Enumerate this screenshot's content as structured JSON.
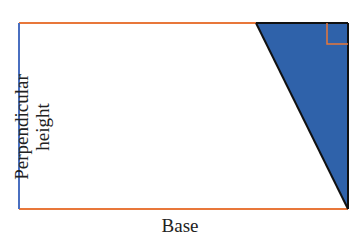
{
  "diagram": {
    "labels": {
      "height_line1": "Perpendicular",
      "height_line2": "height",
      "base": "Base"
    },
    "colors": {
      "rectangle_edge": "#e8773a",
      "height_edge": "#4a6fc0",
      "triangle_fill": "#2f62aa",
      "triangle_edge": "#111111",
      "right_angle_marker": "#e8773a"
    }
  }
}
